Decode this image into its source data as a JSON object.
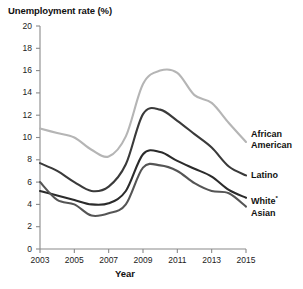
{
  "chart_data": {
    "type": "line",
    "title": "Unemployment rate (%)",
    "xlabel": "Year",
    "ylabel": "Unemployment rate (%)",
    "xlim": [
      2003,
      2015
    ],
    "ylim": [
      0,
      20
    ],
    "xticks": [
      "2003",
      "2005",
      "2007",
      "2009",
      "2011",
      "2013",
      "2015"
    ],
    "yticks": [
      "0",
      "2",
      "4",
      "6",
      "8",
      "10",
      "12",
      "14",
      "16",
      "18",
      "20"
    ],
    "grid": false,
    "legend_position": "right-inline-labels",
    "x": [
      2003,
      2004,
      2005,
      2006,
      2007,
      2008,
      2009,
      2010,
      2011,
      2012,
      2013,
      2014,
      2015
    ],
    "series": [
      {
        "name": "African American",
        "label": "African American",
        "color": "#b5b5b5",
        "values": [
          10.8,
          10.4,
          10.0,
          8.9,
          8.3,
          10.1,
          14.8,
          16.0,
          15.8,
          13.8,
          13.1,
          11.3,
          9.6
        ]
      },
      {
        "name": "Latino",
        "label": "Latino",
        "color": "#3a3a3a",
        "values": [
          7.7,
          7.0,
          6.0,
          5.2,
          5.6,
          7.6,
          12.1,
          12.5,
          11.5,
          10.3,
          9.1,
          7.4,
          6.6
        ]
      },
      {
        "name": "White",
        "label": "White",
        "footnote_marker": "*",
        "color": "#2b2b2b",
        "values": [
          5.2,
          4.8,
          4.4,
          4.0,
          4.1,
          5.2,
          8.5,
          8.7,
          7.9,
          7.2,
          6.5,
          5.3,
          4.6
        ]
      },
      {
        "name": "Asian",
        "label": "Asian",
        "color": "#555555",
        "values": [
          6.0,
          4.4,
          4.0,
          3.0,
          3.2,
          4.0,
          7.3,
          7.5,
          7.0,
          5.9,
          5.2,
          5.0,
          3.8
        ]
      }
    ]
  },
  "labels": {
    "african_american_line1": "African",
    "african_american_line2": "American",
    "latino": "Latino",
    "white": "White",
    "white_marker": "*",
    "asian": "Asian"
  }
}
